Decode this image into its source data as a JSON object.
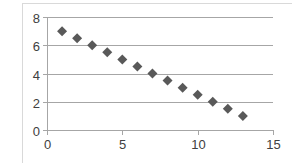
{
  "chart_data": {
    "type": "scatter",
    "title": "",
    "xlabel": "",
    "ylabel": "",
    "xlim": [
      0,
      15
    ],
    "ylim": [
      0,
      8
    ],
    "x_ticks": [
      0,
      5,
      10,
      15
    ],
    "y_ticks": [
      0,
      2,
      4,
      6,
      8
    ],
    "grid": {
      "horizontal": true,
      "vertical": false
    },
    "legend": null,
    "series": [
      {
        "name": "Series1",
        "marker": "diamond",
        "color": "#595959",
        "x": [
          1,
          2,
          3,
          4,
          5,
          6,
          7,
          8,
          9,
          10,
          11,
          12,
          13
        ],
        "y": [
          7,
          6.5,
          6,
          5.5,
          5,
          4.5,
          4,
          3.5,
          3,
          2.5,
          2,
          1.5,
          1
        ]
      }
    ]
  },
  "colors": {
    "gridline": "#a6a6a6",
    "axis": "#a6a6a6",
    "frame": "#d9d9d9",
    "tick_label": "#404040"
  }
}
